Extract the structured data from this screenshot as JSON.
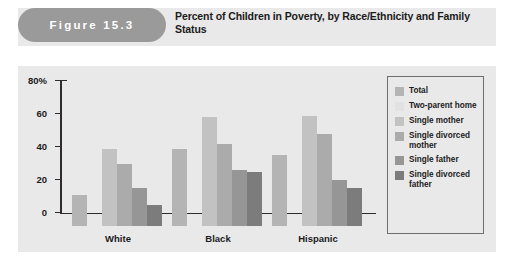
{
  "figure": {
    "number_label": "Figure 15.3",
    "title": "Percent of Children in Poverty, by Race/Ethnicity and Family Status"
  },
  "chart_data": {
    "type": "bar",
    "title": "Percent of Children in Poverty, by Race/Ethnicity and Family Status",
    "xlabel": "",
    "ylabel": "",
    "ylim": [
      0,
      80
    ],
    "ytick_labels": [
      "0",
      "20",
      "40",
      "60",
      "80%"
    ],
    "ytick_values": [
      0,
      20,
      40,
      60,
      80
    ],
    "grid": false,
    "legend_position": "right",
    "categories": [
      "White",
      "Black",
      "Hispanic"
    ],
    "series": [
      {
        "name": "Total",
        "color": "#b4b4b4",
        "values": [
          19,
          47,
          43
        ]
      },
      {
        "name": "Two-parent home",
        "color": "#e2e2e2",
        "values": [
          0,
          0,
          0
        ]
      },
      {
        "name": "Single mother",
        "color": "#c2c2c2",
        "values": [
          47,
          66,
          67
        ]
      },
      {
        "name": "Single divorced mother",
        "color": "#ababab",
        "values": [
          38,
          50,
          56
        ]
      },
      {
        "name": "Single father",
        "color": "#969696",
        "values": [
          23,
          34,
          28
        ]
      },
      {
        "name": "Single divorced father",
        "color": "#7c7c7c",
        "values": [
          13,
          33,
          23
        ]
      }
    ]
  },
  "legend": {
    "items": [
      {
        "label": "Total"
      },
      {
        "label": "Two-parent home"
      },
      {
        "label": "Single mother"
      },
      {
        "label": "Single divorced mother"
      },
      {
        "label": "Single father"
      },
      {
        "label": "Single divorced father"
      }
    ]
  }
}
